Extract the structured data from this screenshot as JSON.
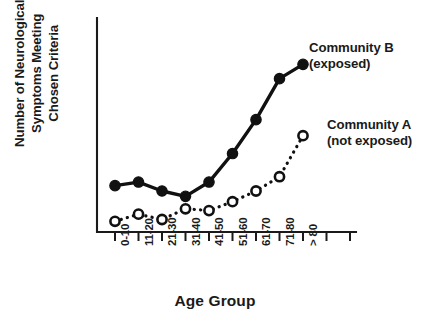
{
  "chart_data": {
    "type": "line",
    "title": "",
    "xlabel": "Age Group",
    "ylabel": "Number of Neurological Symptoms Meeting Chosen Criteria",
    "categories": [
      "0-10",
      "11-20",
      "21-30",
      "31-40",
      "41-50",
      "51-60",
      "61-70",
      "71-80",
      "> 80"
    ],
    "series": [
      {
        "name": "Community B (exposed)",
        "marker": "filled-circle",
        "linestyle": "solid",
        "values": [
          2.6,
          2.8,
          2.3,
          2.0,
          2.8,
          4.4,
          6.3,
          8.6,
          9.4
        ]
      },
      {
        "name": "Community A (not exposed)",
        "marker": "open-circle",
        "linestyle": "dotted",
        "values": [
          0.6,
          1.0,
          0.7,
          1.3,
          1.2,
          1.7,
          2.3,
          3.1,
          5.4
        ]
      }
    ],
    "ylim": [
      0,
      12
    ],
    "xlim": [
      0,
      11
    ],
    "grid": false,
    "axis_ticks_total": 11,
    "legend": "annotations",
    "ylabel_lines": [
      "Number of Neurological",
      "Symptoms Meeting",
      "Chosen Criteria"
    ]
  },
  "annotations": {
    "series_b": {
      "line1": "Community B",
      "line2": "(exposed)"
    },
    "series_a": {
      "line1": "Community A",
      "line2": "(not exposed)"
    }
  },
  "axis_titles": {
    "x": "Age Group"
  },
  "colors": {
    "ink": "#111111",
    "background": "#ffffff"
  }
}
